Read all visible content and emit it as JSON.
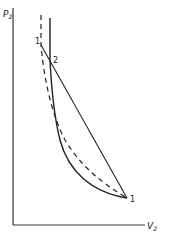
{
  "diagram": {
    "axes": {
      "y_label": "P",
      "y_label_sub": "2",
      "x_label": "V",
      "x_label_sub": "2"
    },
    "points": [
      {
        "label": "1",
        "position": "top-left on straight line (Rayleigh line upper end)"
      },
      {
        "label": "2",
        "position": "intersection of straight line and solid curve"
      },
      {
        "label": "1",
        "position": "bottom-right, common end point of curves"
      }
    ],
    "curves": [
      {
        "name": "solid-curve",
        "style": "solid"
      },
      {
        "name": "dashed-curve",
        "style": "dashed"
      },
      {
        "name": "straight-line",
        "style": "solid"
      }
    ],
    "colors": {
      "ink": "#222222",
      "background": "#ffffff"
    }
  }
}
